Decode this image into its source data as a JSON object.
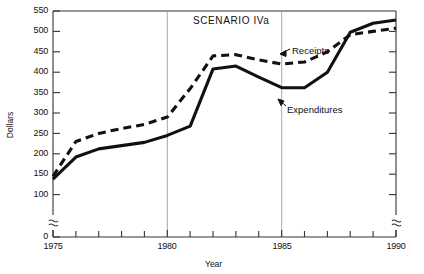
{
  "chart_data": {
    "type": "line",
    "title": "SCENARIO IVa",
    "xlabel": "Year",
    "ylabel": "Dollars",
    "xlim": [
      1975,
      1990
    ],
    "ylim": [
      0,
      550
    ],
    "y_axis_break": true,
    "y_break_between": [
      0,
      100
    ],
    "grid": "vertical gridlines at 1980 and 1985",
    "gridlines_x": [
      1980,
      1985
    ],
    "legend_position": "inline annotations with leader arrows",
    "x_ticks_major": [
      1975,
      1980,
      1985,
      1990
    ],
    "x_tick_labels": [
      "1975",
      "1980",
      "1985",
      "1990"
    ],
    "x_ticks_minor": [
      1976,
      1977,
      1978,
      1979,
      1981,
      1982,
      1983,
      1984,
      1986,
      1987,
      1988,
      1989
    ],
    "y_ticks": [
      0,
      100,
      150,
      200,
      250,
      300,
      350,
      400,
      450,
      500,
      550
    ],
    "y_tick_labels": [
      "0",
      "100",
      "150",
      "200",
      "250",
      "300",
      "350",
      "400",
      "450",
      "500",
      "550"
    ],
    "x": [
      1975,
      1976,
      1977,
      1978,
      1979,
      1980,
      1981,
      1982,
      1983,
      1984,
      1985,
      1986,
      1987,
      1988,
      1989,
      1990
    ],
    "series": [
      {
        "name": "Receipts",
        "style": "dashed",
        "values": [
          145,
          230,
          250,
          262,
          272,
          290,
          360,
          440,
          443,
          430,
          420,
          425,
          450,
          492,
          500,
          508
        ]
      },
      {
        "name": "Expenditures",
        "style": "solid",
        "values": [
          138,
          192,
          212,
          220,
          228,
          245,
          268,
          408,
          415,
          388,
          362,
          362,
          400,
          498,
          520,
          528
        ]
      }
    ],
    "annotations": [
      {
        "text": "Receipts",
        "points_to_series": "Receipts"
      },
      {
        "text": "Expenditures",
        "points_to_series": "Expenditures"
      }
    ]
  },
  "colors": {
    "line": "#111111",
    "axis": "#333333",
    "gridline": "#888888",
    "background": "#ffffff"
  }
}
